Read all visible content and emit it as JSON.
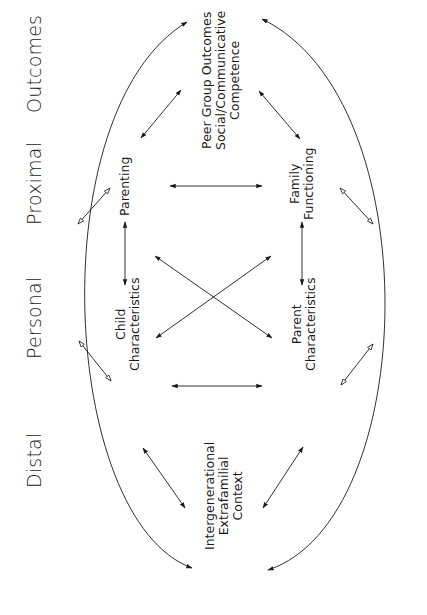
{
  "stages": [
    {
      "id": "outcomes",
      "label": "Outcomes"
    },
    {
      "id": "proximal",
      "label": "Proximal"
    },
    {
      "id": "personal",
      "label": "Personal"
    },
    {
      "id": "distal",
      "label": "Distal"
    }
  ],
  "nodes": {
    "peer_group": {
      "lines": [
        "Peer Group Outcomes",
        "Social/Communicative",
        "Competence"
      ]
    },
    "parenting": {
      "lines": [
        "Parenting"
      ]
    },
    "family_functioning": {
      "lines": [
        "Family",
        "Functioning"
      ]
    },
    "child_characteristics": {
      "lines": [
        "Child",
        "Characteristics"
      ]
    },
    "parent_characteristics": {
      "lines": [
        "Parent",
        "Characteristics"
      ]
    },
    "intergenerational": {
      "lines": [
        "Intergenerational",
        "Extrafamilial",
        "Context"
      ]
    }
  },
  "connections": [
    {
      "from": "intergenerational",
      "to": "peer_group",
      "style": "outer-arc",
      "side": "left"
    },
    {
      "from": "intergenerational",
      "to": "peer_group",
      "style": "outer-arc",
      "side": "right"
    },
    {
      "from": "parenting",
      "to": "peer_group",
      "style": "solid-double"
    },
    {
      "from": "family_functioning",
      "to": "peer_group",
      "style": "solid-double"
    },
    {
      "from": "parenting",
      "to": "family_functioning",
      "style": "solid-double"
    },
    {
      "from": "child_characteristics",
      "to": "parent_characteristics",
      "style": "solid-double"
    },
    {
      "from": "parenting",
      "to": "child_characteristics",
      "style": "solid-double"
    },
    {
      "from": "family_functioning",
      "to": "parent_characteristics",
      "style": "solid-double"
    },
    {
      "from": "parenting",
      "to": "parent_characteristics",
      "style": "solid-double"
    },
    {
      "from": "family_functioning",
      "to": "child_characteristics",
      "style": "solid-double"
    },
    {
      "from": "child_characteristics",
      "to": "intergenerational",
      "style": "solid-double"
    },
    {
      "from": "parent_characteristics",
      "to": "intergenerational",
      "style": "solid-double"
    },
    {
      "from": "outer-left-proximal",
      "to": "outer-left-proximal",
      "style": "hollow-double"
    },
    {
      "from": "outer-left-personal",
      "to": "outer-left-personal",
      "style": "hollow-double"
    },
    {
      "from": "outer-right-proximal",
      "to": "outer-right-proximal",
      "style": "hollow-double"
    },
    {
      "from": "outer-right-personal",
      "to": "outer-right-personal",
      "style": "hollow-double"
    }
  ],
  "colors": {
    "ink": "#1a1a1a",
    "background": "#ffffff"
  }
}
